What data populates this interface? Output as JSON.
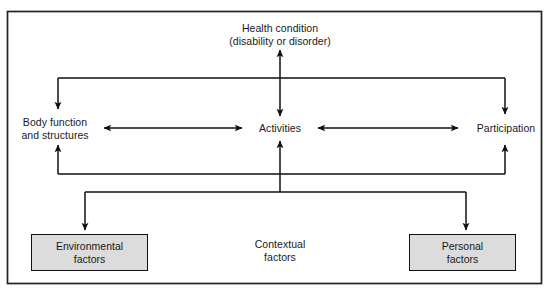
{
  "diagram": {
    "frame": {
      "border_color": "#222222"
    },
    "colors": {
      "box_fill": "#dcdcdc",
      "box_border": "#111111",
      "line": "#111111",
      "text": "#1a1a1a",
      "background": "#ffffff"
    },
    "nodes": {
      "health_condition": {
        "line1": "Health condition",
        "line2": "(disability or disorder)"
      },
      "body_function": {
        "line1": "Body function",
        "line2": "and structures"
      },
      "activities": {
        "line1": "Activities"
      },
      "participation": {
        "line1": "Participation"
      },
      "contextual_factors": {
        "line1": "Contextual",
        "line2": "factors"
      },
      "environmental_factors": {
        "line1": "Environmental",
        "line2": "factors"
      },
      "personal_factors": {
        "line1": "Personal",
        "line2": "factors"
      }
    },
    "connectors": [
      {
        "name": "health-condition-to-activities",
        "type": "double-arrow-vertical"
      },
      {
        "name": "health-condition-bracket-to-body-function",
        "type": "arrow-down"
      },
      {
        "name": "health-condition-bracket-to-participation",
        "type": "arrow-down"
      },
      {
        "name": "body-function-to-activities",
        "type": "double-arrow-horizontal"
      },
      {
        "name": "activities-to-participation",
        "type": "double-arrow-horizontal"
      },
      {
        "name": "lower-bracket-to-body-function",
        "type": "arrow-up"
      },
      {
        "name": "lower-bracket-to-activities",
        "type": "arrow-up"
      },
      {
        "name": "lower-bracket-to-participation",
        "type": "arrow-up"
      },
      {
        "name": "contextual-bracket-to-environmental-factors",
        "type": "arrow-down"
      },
      {
        "name": "contextual-bracket-to-personal-factors",
        "type": "arrow-down"
      }
    ]
  }
}
